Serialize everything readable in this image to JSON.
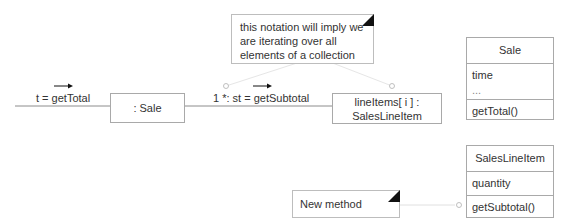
{
  "diagram": {
    "type": "UML collaboration diagram",
    "messages": {
      "incoming": "t = getTotal",
      "iterated": "1 *: st = getSubtotal"
    },
    "objects": {
      "sale": ": Sale",
      "line_items_line1": "lineItems[ i ] :",
      "line_items_line2": "SalesLineItem"
    },
    "notes": {
      "iteration_line1": "this notation will imply we",
      "iteration_line2": "are iterating over all",
      "iteration_line3": "elements of a collection",
      "new_method": "New method"
    },
    "classes": {
      "sale": {
        "name": "Sale",
        "attributes": [
          "time",
          "..."
        ],
        "methods": [
          "getTotal()"
        ]
      },
      "sales_line_item": {
        "name": "SalesLineItem",
        "attributes": [
          "quantity"
        ],
        "methods": [
          "getSubtotal()"
        ]
      }
    },
    "colors": {
      "line": "#8c8c8c",
      "border": "#a9a9a9",
      "text": "#333333",
      "arrow": "#111111"
    }
  }
}
